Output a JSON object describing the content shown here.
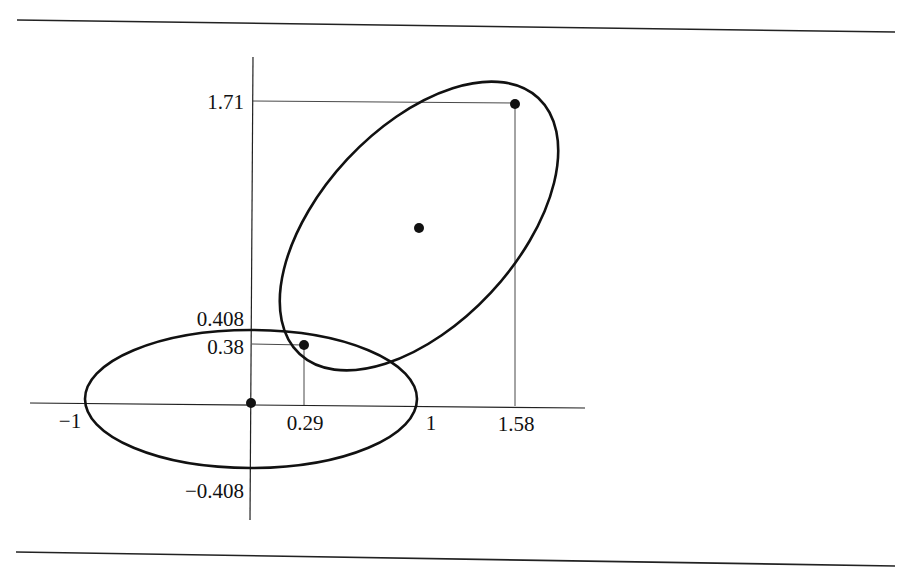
{
  "figure": {
    "colors": {
      "ink": "#111111",
      "guide": "#333333",
      "background": "#ffffff"
    }
  },
  "axes": {
    "x_ticks": [
      {
        "value": -1,
        "label": "−1"
      },
      {
        "value": 0.29,
        "label": "0.29"
      },
      {
        "value": 1,
        "label": "1"
      },
      {
        "value": 1.58,
        "label": "1.58"
      }
    ],
    "y_ticks": [
      {
        "value": 1.71,
        "label": "1.71"
      },
      {
        "value": 0.408,
        "label": "0.408"
      },
      {
        "value": 0.38,
        "label": "0.38"
      },
      {
        "value": -0.408,
        "label": "−0.408"
      }
    ]
  },
  "ellipses": [
    {
      "name": "ellipse-at-origin",
      "center": [
        0,
        0
      ],
      "semi_x": 1,
      "semi_y": 0.408,
      "rotation_deg": 0
    },
    {
      "name": "rotated-ellipse",
      "center": [
        1.01,
        0.99
      ],
      "rotation_deg": -42
    }
  ],
  "points": [
    {
      "name": "origin-point",
      "x": 0,
      "y": 0
    },
    {
      "name": "tangent-point",
      "x": 0.29,
      "y": 0.38
    },
    {
      "name": "top-point",
      "x": 1.58,
      "y": 1.71
    },
    {
      "name": "rotated-ellipse-center",
      "x": 1.01,
      "y": 0.99
    }
  ]
}
